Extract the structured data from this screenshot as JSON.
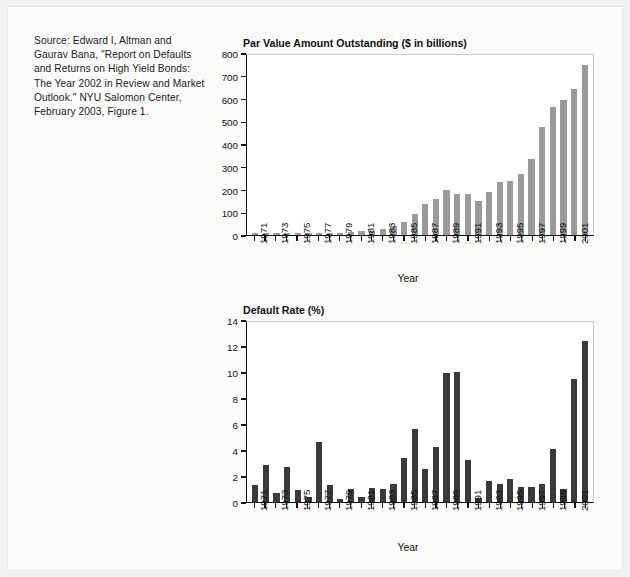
{
  "source_note": "Source: Edward I, Altman and Gaurav Bana, \"Report on Defaults and Returns on High Yield Bonds: The Year 2002 in Review and Market Outlook.\" NYU Salomon Center, February 2003, Figure 1.",
  "colors": {
    "page_background": "#f2f2f0",
    "sheet_background": "#fbfbf9",
    "plot_background": "#ffffff",
    "axis": "#111111",
    "bar_top_chart": "#9a9a9a",
    "bar_bottom_chart": "#3a3a3a"
  },
  "chart_data": [
    {
      "type": "bar",
      "title": "Par Value Amount Outstanding ($ in billions)",
      "xlabel": "Year",
      "ylabel": "",
      "ylim": [
        0,
        800
      ],
      "yticks": [
        0,
        100,
        200,
        300,
        400,
        500,
        600,
        700,
        800
      ],
      "grid": false,
      "legend": "none",
      "bar_color": "#9a9a9a",
      "categories": [
        1971,
        1972,
        1973,
        1974,
        1975,
        1976,
        1977,
        1978,
        1979,
        1980,
        1981,
        1982,
        1983,
        1984,
        1985,
        1986,
        1987,
        1988,
        1989,
        1990,
        1991,
        1992,
        1993,
        1994,
        1995,
        1996,
        1997,
        1998,
        1999,
        2000,
        2001,
        2002
      ],
      "tick_labels": [
        "1971",
        "",
        "1973",
        "",
        "1975",
        "",
        "1977",
        "",
        "1979",
        "",
        "1981",
        "",
        "1983",
        "",
        "1985",
        "",
        "1987",
        "",
        "1989",
        "",
        "1991",
        "",
        "1993",
        "",
        "1995",
        "",
        "1997",
        "",
        "1999",
        "",
        "2001",
        ""
      ],
      "values": [
        7,
        7,
        8,
        11,
        7,
        8,
        9,
        9,
        10,
        15,
        17,
        18,
        27,
        41,
        59,
        92,
        137,
        159,
        201,
        181,
        183,
        151,
        193,
        235,
        240,
        271,
        336,
        481,
        567,
        598,
        649,
        757
      ]
    },
    {
      "type": "bar",
      "title": "Default Rate (%)",
      "xlabel": "Year",
      "ylabel": "",
      "ylim": [
        0,
        14
      ],
      "yticks": [
        0,
        2,
        4,
        6,
        8,
        10,
        12,
        14
      ],
      "grid": false,
      "legend": "none",
      "bar_color": "#3a3a3a",
      "categories": [
        1971,
        1972,
        1973,
        1974,
        1975,
        1976,
        1977,
        1978,
        1979,
        1980,
        1981,
        1982,
        1983,
        1984,
        1985,
        1986,
        1987,
        1988,
        1989,
        1990,
        1991,
        1992,
        1993,
        1994,
        1995,
        1996,
        1997,
        1998,
        1999,
        2000,
        2001,
        2002
      ],
      "tick_labels": [
        "1971",
        "",
        "1973",
        "",
        "1975",
        "",
        "1977",
        "",
        "1979",
        "",
        "1981",
        "",
        "1983",
        "",
        "1985",
        "",
        "1987",
        "",
        "1989",
        "",
        "1991",
        "",
        "1993",
        "",
        "1995",
        "",
        "1997",
        "",
        "1999",
        "",
        "2001",
        ""
      ],
      "values": [
        1.3,
        2.9,
        0.7,
        2.7,
        0.9,
        0.4,
        4.7,
        1.3,
        0.2,
        1.0,
        0.4,
        1.1,
        1.0,
        1.4,
        3.4,
        5.7,
        2.6,
        4.3,
        10.0,
        10.1,
        3.3,
        0.3,
        1.6,
        1.4,
        1.8,
        1.2,
        1.2,
        1.4,
        4.1,
        1.0,
        9.6,
        12.5
      ]
    }
  ]
}
